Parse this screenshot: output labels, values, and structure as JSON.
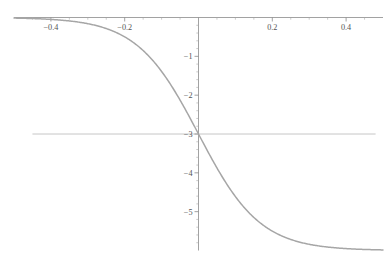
{
  "chart_data": {
    "type": "line",
    "title": "",
    "subtitle": "",
    "xlabel": "",
    "ylabel": "",
    "xlim": [
      -0.5,
      0.5
    ],
    "ylim": [
      -6.0,
      0.0
    ],
    "grid": false,
    "legend": null,
    "legend_position": "none",
    "x_ticks_major": [
      -0.4,
      -0.2,
      0.2,
      0.4
    ],
    "x_tick_labels": [
      "-0.4",
      "-0.2",
      "0.2",
      "0.4"
    ],
    "x_ticks_minor": [
      -0.45,
      -0.35,
      -0.3,
      -0.25,
      -0.15,
      -0.1,
      -0.05,
      0.05,
      0.1,
      0.15,
      0.25,
      0.3,
      0.35,
      0.45
    ],
    "y_ticks_major": [
      -1,
      -2,
      -3,
      -4,
      -5
    ],
    "y_tick_labels": [
      "-1",
      "-2",
      "-3",
      "-4",
      "-5"
    ],
    "y_ticks_minor": [
      -0.2,
      -0.4,
      -0.6,
      -0.8,
      -1.2,
      -1.4,
      -1.6,
      -1.8,
      -2.2,
      -2.4,
      -2.6,
      -2.8,
      -3.2,
      -3.4,
      -3.6,
      -3.8,
      -4.2,
      -4.4,
      -4.6,
      -4.8,
      -5.2,
      -5.4,
      -5.6,
      -5.8
    ],
    "axis_origin": [
      0,
      0
    ],
    "reference_lines": [
      {
        "name": "horizontal-asymptote-midpoint",
        "orientation": "horizontal",
        "value": -3,
        "x_start": -0.45,
        "x_end": 0.48
      }
    ],
    "series": [
      {
        "name": "sigmoid",
        "color": "#a6a6a6",
        "x": [
          -0.5,
          -0.48,
          -0.46,
          -0.44,
          -0.42,
          -0.4,
          -0.38,
          -0.36,
          -0.34,
          -0.32,
          -0.3,
          -0.28,
          -0.26,
          -0.24,
          -0.22,
          -0.2,
          -0.18,
          -0.16,
          -0.14,
          -0.12,
          -0.1,
          -0.08,
          -0.06,
          -0.04,
          -0.02,
          0.0,
          0.02,
          0.04,
          0.06,
          0.08,
          0.1,
          0.12,
          0.14,
          0.16,
          0.18,
          0.2,
          0.22,
          0.24,
          0.26,
          0.28,
          0.3,
          0.32,
          0.34,
          0.36,
          0.38,
          0.4,
          0.42,
          0.44,
          0.46,
          0.48,
          0.5
        ],
        "y": [
          -0.015,
          -0.019,
          -0.024,
          -0.03,
          -0.039,
          -0.049,
          -0.062,
          -0.079,
          -0.1,
          -0.127,
          -0.161,
          -0.203,
          -0.257,
          -0.324,
          -0.407,
          -0.511,
          -0.639,
          -0.797,
          -0.989,
          -1.222,
          -1.501,
          -1.827,
          -2.203,
          -2.624,
          -3.084,
          -3.0,
          -3.423,
          -3.882,
          -4.34,
          -4.768,
          -5.142,
          -5.449,
          -5.685,
          -5.857,
          -5.976,
          -6.0,
          -6.0,
          -6.0,
          -6.0,
          -6.0,
          -6.0,
          -6.0,
          -6.0,
          -6.0,
          -6.0,
          -6.0,
          -6.0,
          -6.0,
          -6.0,
          -6.0,
          -6.0
        ]
      }
    ],
    "annotations": [],
    "colors": {
      "curve": "#a6a6a6",
      "axis": "#8a8a8a",
      "tick_label": "#545454",
      "reference_line": "#b8b8b8",
      "background": "#ffffff"
    }
  }
}
